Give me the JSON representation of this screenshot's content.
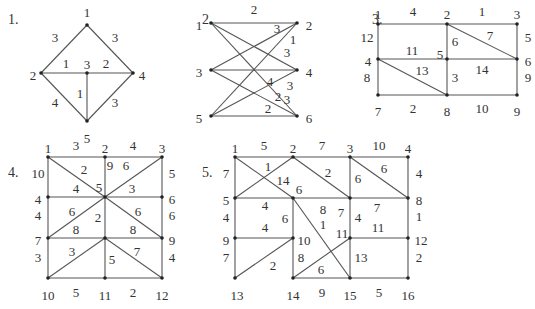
{
  "graphs": [
    {
      "id": "1",
      "title": "1.",
      "nodes": [
        {
          "id": "1"
        },
        {
          "id": "2"
        },
        {
          "id": "3"
        },
        {
          "id": "4"
        },
        {
          "id": "5"
        }
      ],
      "edges": [
        {
          "from": "1",
          "to": "2",
          "w": "3"
        },
        {
          "from": "1",
          "to": "4",
          "w": "3"
        },
        {
          "from": "2",
          "to": "3",
          "w": "1"
        },
        {
          "from": "3",
          "to": "4",
          "w": "2"
        },
        {
          "from": "3",
          "to": "5",
          "w": "1"
        },
        {
          "from": "2",
          "to": "5",
          "w": "4"
        },
        {
          "from": "4",
          "to": "5",
          "w": "3"
        }
      ]
    },
    {
      "id": "2",
      "title": "2.",
      "nodes": [
        {
          "id": "1"
        },
        {
          "id": "2"
        },
        {
          "id": "3"
        },
        {
          "id": "4"
        },
        {
          "id": "5"
        },
        {
          "id": "6"
        }
      ],
      "edges": [
        {
          "from": "1",
          "to": "2",
          "w": "2"
        },
        {
          "from": "1",
          "to": "4",
          "w": "3"
        },
        {
          "from": "1",
          "to": "6",
          "w": "3"
        },
        {
          "from": "3",
          "to": "2",
          "w": "3"
        },
        {
          "from": "3",
          "to": "4",
          "w": "4"
        },
        {
          "from": "3",
          "to": "6",
          "w": "3"
        },
        {
          "from": "5",
          "to": "2",
          "w": "1"
        },
        {
          "from": "5",
          "to": "4",
          "w": "2"
        },
        {
          "from": "5",
          "to": "6",
          "w": "2"
        }
      ]
    },
    {
      "id": "3",
      "title": "3.",
      "nodes": [
        {
          "id": "1"
        },
        {
          "id": "2"
        },
        {
          "id": "3"
        },
        {
          "id": "4"
        },
        {
          "id": "5"
        },
        {
          "id": "6"
        },
        {
          "id": "7"
        },
        {
          "id": "8"
        },
        {
          "id": "9"
        }
      ],
      "edges": [
        {
          "from": "1",
          "to": "2",
          "w": "4"
        },
        {
          "from": "2",
          "to": "3",
          "w": "1"
        },
        {
          "from": "1",
          "to": "4",
          "w": "12"
        },
        {
          "from": "3",
          "to": "6",
          "w": "5"
        },
        {
          "from": "2",
          "to": "5",
          "w": "6"
        },
        {
          "from": "2",
          "to": "6",
          "w": "7"
        },
        {
          "from": "4",
          "to": "5",
          "w": "11"
        },
        {
          "from": "5",
          "to": "6",
          "w": "14"
        },
        {
          "from": "4",
          "to": "7",
          "w": "8"
        },
        {
          "from": "4",
          "to": "8",
          "w": "13"
        },
        {
          "from": "5",
          "to": "8",
          "w": "3"
        },
        {
          "from": "6",
          "to": "9",
          "w": "9"
        },
        {
          "from": "7",
          "to": "8",
          "w": "2"
        },
        {
          "from": "8",
          "to": "9",
          "w": "10"
        }
      ]
    },
    {
      "id": "4",
      "title": "4.",
      "nodes": [
        {
          "id": "1"
        },
        {
          "id": "2"
        },
        {
          "id": "3"
        },
        {
          "id": "4"
        },
        {
          "id": "5"
        },
        {
          "id": "6"
        },
        {
          "id": "7"
        },
        {
          "id": "8"
        },
        {
          "id": "9"
        },
        {
          "id": "10"
        },
        {
          "id": "11"
        },
        {
          "id": "12"
        }
      ],
      "edges": [
        {
          "from": "1",
          "to": "2",
          "w": "3"
        },
        {
          "from": "2",
          "to": "3",
          "w": "4"
        },
        {
          "from": "1",
          "to": "4",
          "w": "10"
        },
        {
          "from": "3",
          "to": "6",
          "w": "5"
        },
        {
          "from": "1",
          "to": "5",
          "w": "2"
        },
        {
          "from": "2",
          "to": "5",
          "w": "9"
        },
        {
          "from": "3",
          "to": "5",
          "w": "6"
        },
        {
          "from": "4",
          "to": "5",
          "w": "4"
        },
        {
          "from": "5",
          "to": "6",
          "w": "3"
        },
        {
          "from": "4",
          "to": "7",
          "w": "4"
        },
        {
          "from": "6",
          "to": "9",
          "w": "6"
        },
        {
          "from": "5",
          "to": "7",
          "w": "6"
        },
        {
          "from": "5",
          "to": "8",
          "w": "2"
        },
        {
          "from": "5",
          "to": "9",
          "w": "6"
        },
        {
          "from": "7",
          "to": "8",
          "w": "8"
        },
        {
          "from": "8",
          "to": "9",
          "w": "8"
        },
        {
          "from": "7",
          "to": "10",
          "w": "3"
        },
        {
          "from": "9",
          "to": "12",
          "w": "4"
        },
        {
          "from": "8",
          "to": "10",
          "w": "3"
        },
        {
          "from": "8",
          "to": "11",
          "w": "5"
        },
        {
          "from": "8",
          "to": "12",
          "w": "7"
        },
        {
          "from": "10",
          "to": "11",
          "w": "5"
        },
        {
          "from": "11",
          "to": "12",
          "w": "2"
        }
      ]
    },
    {
      "id": "5",
      "title": "5.",
      "nodes": [
        {
          "id": "1"
        },
        {
          "id": "2"
        },
        {
          "id": "3"
        },
        {
          "id": "4"
        },
        {
          "id": "5"
        },
        {
          "id": "6"
        },
        {
          "id": "7"
        },
        {
          "id": "8"
        },
        {
          "id": "9"
        },
        {
          "id": "10"
        },
        {
          "id": "11"
        },
        {
          "id": "12"
        },
        {
          "id": "13"
        },
        {
          "id": "14"
        },
        {
          "id": "15"
        },
        {
          "id": "16"
        }
      ],
      "edges": [
        {
          "from": "1",
          "to": "2",
          "w": "5"
        },
        {
          "from": "2",
          "to": "3",
          "w": "7"
        },
        {
          "from": "3",
          "to": "4",
          "w": "10"
        },
        {
          "from": "1",
          "to": "5",
          "w": "7"
        },
        {
          "from": "1",
          "to": "6",
          "w": "14"
        },
        {
          "from": "5",
          "to": "2",
          "w": "1"
        },
        {
          "from": "2",
          "to": "7",
          "w": "2"
        },
        {
          "from": "3",
          "to": "7",
          "w": "6"
        },
        {
          "from": "3",
          "to": "8",
          "w": "6"
        },
        {
          "from": "4",
          "to": "8",
          "w": "4"
        },
        {
          "from": "5",
          "to": "6",
          "w": "4"
        },
        {
          "from": "6",
          "to": "7",
          "w": "8"
        },
        {
          "from": "7",
          "to": "8",
          "w": "7"
        },
        {
          "from": "5",
          "to": "9",
          "w": "4"
        },
        {
          "from": "6",
          "to": "10",
          "w": "6"
        },
        {
          "from": "6",
          "to": "15",
          "w": "1"
        },
        {
          "from": "7",
          "to": "11",
          "w": "4"
        },
        {
          "from": "8",
          "to": "12",
          "w": "1"
        },
        {
          "from": "9",
          "to": "10",
          "w": "4"
        },
        {
          "from": "11",
          "to": "12",
          "w": "11"
        },
        {
          "from": "9",
          "to": "13",
          "w": "7"
        },
        {
          "from": "13",
          "to": "10",
          "w": "2"
        },
        {
          "from": "10",
          "to": "14",
          "w": "8"
        },
        {
          "from": "14",
          "to": "11",
          "w": "6"
        },
        {
          "from": "11",
          "to": "15",
          "w": "13"
        },
        {
          "from": "12",
          "to": "16",
          "w": "2"
        },
        {
          "from": "14",
          "to": "15",
          "w": "9"
        },
        {
          "from": "15",
          "to": "16",
          "w": "5"
        }
      ]
    }
  ]
}
